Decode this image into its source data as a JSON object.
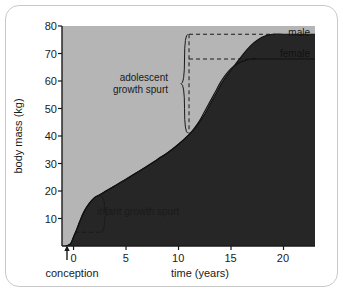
{
  "chart_data": {
    "type": "area",
    "title": "",
    "subtitle": "",
    "xlabel": "time (years)",
    "ylabel": "body mass (kg)",
    "xlim": [
      -1.1,
      23
    ],
    "ylim": [
      0,
      80
    ],
    "xticks": [
      "0",
      "5",
      "10",
      "15",
      "20"
    ],
    "xtick_values": [
      0,
      5,
      10,
      15,
      20
    ],
    "yticks": [
      "10",
      "20",
      "30",
      "40",
      "50",
      "60",
      "70",
      "80"
    ],
    "ytick_values": [
      10,
      20,
      30,
      40,
      50,
      60,
      70,
      80
    ],
    "grid": false,
    "legend_position": "top-right",
    "series": [
      {
        "name": "male",
        "label": "male",
        "plateau_value": 77,
        "x": [
          -0.75,
          -0.5,
          -0.25,
          0,
          0.3,
          0.6,
          1.0,
          1.5,
          2.0,
          2.5,
          3.0,
          4.0,
          5.0,
          6.0,
          7.0,
          8.0,
          9.0,
          10.0,
          11.0,
          11.5,
          12.0,
          12.5,
          13.0,
          13.5,
          14.0,
          14.5,
          15.0,
          15.5,
          16.0,
          16.5,
          17.0,
          17.5,
          18.0,
          18.5,
          19.0,
          20.0,
          21.0,
          22.0,
          23.0
        ],
        "y": [
          0,
          0.3,
          1.0,
          3.3,
          6.0,
          9.0,
          12.5,
          15.5,
          17.6,
          18.6,
          19.8,
          22.0,
          24.3,
          26.6,
          29.0,
          31.5,
          34.0,
          37.0,
          40.5,
          42.5,
          45.0,
          48.0,
          51.5,
          55.0,
          58.5,
          61.5,
          64.0,
          66.5,
          69.0,
          71.3,
          73.3,
          74.8,
          76.0,
          76.7,
          77.0,
          77.0,
          77.0,
          77.0,
          77.0
        ]
      },
      {
        "name": "female",
        "label": "female",
        "plateau_value": 68,
        "x": [
          -0.75,
          -0.5,
          -0.25,
          0,
          0.3,
          0.6,
          1.0,
          1.5,
          2.0,
          2.5,
          3.0,
          4.0,
          5.0,
          6.0,
          7.0,
          8.0,
          9.0,
          10.0,
          11.0,
          11.5,
          12.0,
          12.5,
          13.0,
          13.5,
          14.0,
          14.5,
          15.0,
          15.5,
          16.0,
          16.5,
          17.0,
          17.5,
          18.0,
          19.0,
          20.0,
          21.0,
          22.0,
          23.0
        ],
        "y": [
          0,
          0.3,
          1.0,
          3.3,
          6.0,
          9.0,
          12.5,
          15.5,
          17.6,
          18.6,
          19.8,
          22.0,
          24.3,
          26.6,
          29.0,
          31.5,
          34.0,
          37.0,
          40.5,
          42.8,
          45.5,
          49.0,
          52.5,
          56.0,
          59.5,
          62.3,
          64.5,
          66.0,
          67.0,
          67.7,
          68.0,
          68.0,
          68.0,
          68.0,
          68.0,
          68.0,
          68.0,
          68.0
        ]
      }
    ],
    "annotations": [
      {
        "name": "adolescent-growth-spurt",
        "text_line1": "adolescent",
        "text_line2": "growth spurt",
        "x_position": 11,
        "y_from": 41,
        "y_to": 77
      },
      {
        "name": "infant-growth-spurt",
        "text": "infant growth spurt",
        "x_position": 2.6,
        "y_from": 5,
        "y_to": 18
      },
      {
        "name": "conception-marker",
        "text": "conception",
        "x_position": 0
      }
    ],
    "reference_lines": [
      {
        "name": "male-plateau",
        "orientation": "horizontal",
        "value": 77,
        "style": "dashed"
      },
      {
        "name": "female-plateau",
        "orientation": "horizontal",
        "value": 68,
        "style": "dashed"
      },
      {
        "name": "adolescence-onset",
        "orientation": "vertical",
        "value": 11,
        "style": "dashed"
      }
    ],
    "colors": {
      "plot_background": "#b5b5b5",
      "area_fill": "#262626",
      "curve_stroke": "#111111",
      "axis": "#1a1a1a",
      "figure_background": "#ffffff",
      "frame_border": "#c9c9c9"
    }
  },
  "labels": {
    "ylabel": "body mass (kg)",
    "xlabel": "time (years)",
    "male": "male",
    "female": "female",
    "adolescent_line1": "adolescent",
    "adolescent_line2": "growth spurt",
    "infant": "infant growth spurt",
    "conception": "conception",
    "ytick_10": "10",
    "ytick_20": "20",
    "ytick_30": "30",
    "ytick_40": "40",
    "ytick_50": "50",
    "ytick_60": "60",
    "ytick_70": "70",
    "ytick_80": "80",
    "xtick_0": "0",
    "xtick_5": "5",
    "xtick_10": "10",
    "xtick_15": "15",
    "xtick_20": "20"
  }
}
